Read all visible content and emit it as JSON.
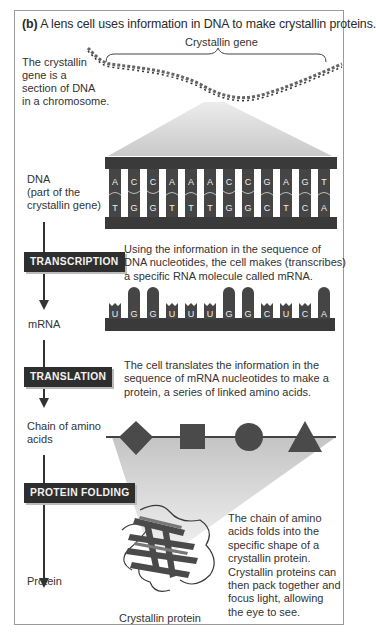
{
  "figure": {
    "panel_label": "(b)",
    "title": "A lens cell uses information in DNA to make crystallin proteins.",
    "gene_label": "Crystallin gene",
    "chromosome_note": [
      "The crystallin",
      "gene is a",
      "section of DNA",
      "in a chromosome."
    ]
  },
  "dna": {
    "label": [
      "DNA",
      "(part of the",
      "crystallin gene)"
    ],
    "top_strand": [
      "A",
      "C",
      "C",
      "A",
      "A",
      "A",
      "C",
      "C",
      "G",
      "A",
      "G",
      "T"
    ],
    "bottom_strand": [
      "T",
      "G",
      "G",
      "T",
      "T",
      "T",
      "G",
      "G",
      "C",
      "T",
      "C",
      "A"
    ]
  },
  "steps": {
    "transcription": {
      "label": "TRANSCRIPTION",
      "description": [
        "Using the information in the sequence of",
        "DNA nucleotides, the cell makes (transcribes)",
        "a specific RNA molecule called mRNA."
      ]
    },
    "translation": {
      "label": "TRANSLATION",
      "description": [
        "The cell translates the information in the",
        "sequence of mRNA nucleotides to make a",
        "protein, a series of linked amino acids."
      ]
    },
    "folding": {
      "label": "PROTEIN FOLDING",
      "description": [
        "The chain of amino",
        "acids folds into the",
        "specific shape of a",
        "crystallin protein.",
        "Crystallin proteins can",
        "then pack together and",
        "focus light, allowing",
        "the eye to see."
      ]
    }
  },
  "mrna": {
    "label": "mRNA",
    "sequence": [
      "U",
      "G",
      "G",
      "U",
      "U",
      "U",
      "G",
      "G",
      "C",
      "U",
      "C",
      "A"
    ]
  },
  "amino_chain": {
    "label": [
      "Chain of amino",
      "acids"
    ],
    "shapes": [
      "diamond",
      "square",
      "circle",
      "triangle"
    ]
  },
  "protein": {
    "label": "Protein",
    "caption": "Crystallin protein"
  },
  "colors": {
    "dark": "#2e2e2e",
    "mid": "#555555",
    "light_gray": "#c8c8c8",
    "fan": "#d9d9d9"
  }
}
